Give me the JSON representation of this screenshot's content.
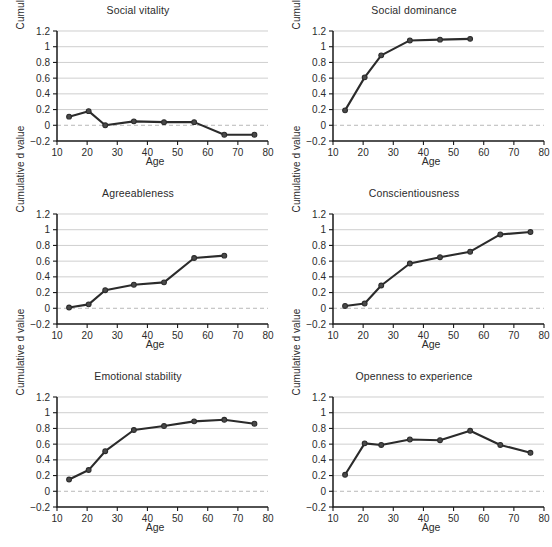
{
  "figure": {
    "axis_label_x": "Age",
    "axis_label_y": "Cumulative d value",
    "x_ticks": [
      "10",
      "20",
      "30",
      "40",
      "50",
      "60",
      "70",
      "80"
    ],
    "y_ticks": [
      "1.2",
      "1",
      "0.8",
      "0.6",
      "0.4",
      "0.2",
      "0",
      "−0.2"
    ],
    "line_color": "#2b2b2b",
    "grid_color": "#b9b9b9",
    "zero_line_color": "#b0b0b0",
    "background_color": "#ffffff"
  },
  "chart_data": [
    {
      "type": "line",
      "title": "Social vitality",
      "xlabel": "Age",
      "ylabel": "Cumulative d value",
      "xlim": [
        10,
        80
      ],
      "ylim": [
        -0.2,
        1.2
      ],
      "xticks": [
        10,
        20,
        30,
        40,
        50,
        60,
        70,
        80
      ],
      "yticks": [
        -0.2,
        0,
        0.2,
        0.4,
        0.6,
        0.8,
        1,
        1.2
      ],
      "grid": "horizontal",
      "legend": "none",
      "x": [
        14,
        20.5,
        26,
        35.5,
        45.5,
        55.5,
        65.5,
        75.5
      ],
      "values": [
        0.11,
        0.18,
        0.0,
        0.05,
        0.04,
        0.04,
        -0.12,
        -0.12
      ]
    },
    {
      "type": "line",
      "title": "Social dominance",
      "xlabel": "Age",
      "ylabel": "Cumulative d value",
      "xlim": [
        10,
        80
      ],
      "ylim": [
        -0.2,
        1.2
      ],
      "xticks": [
        10,
        20,
        30,
        40,
        50,
        60,
        70,
        80
      ],
      "yticks": [
        -0.2,
        0,
        0.2,
        0.4,
        0.6,
        0.8,
        1,
        1.2
      ],
      "grid": "horizontal",
      "legend": "none",
      "x": [
        14,
        20.5,
        26,
        35.5,
        45.5,
        55.5
      ],
      "values": [
        0.19,
        0.61,
        0.89,
        1.08,
        1.09,
        1.1
      ]
    },
    {
      "type": "line",
      "title": "Agreeableness",
      "xlabel": "Age",
      "ylabel": "Cumulative d value",
      "xlim": [
        10,
        80
      ],
      "ylim": [
        -0.2,
        1.2
      ],
      "xticks": [
        10,
        20,
        30,
        40,
        50,
        60,
        70,
        80
      ],
      "yticks": [
        -0.2,
        0,
        0.2,
        0.4,
        0.6,
        0.8,
        1,
        1.2
      ],
      "grid": "horizontal",
      "legend": "none",
      "x": [
        14,
        20.5,
        26,
        35.5,
        45.5,
        55.5,
        65.5
      ],
      "values": [
        0.01,
        0.05,
        0.23,
        0.3,
        0.33,
        0.64,
        0.67
      ]
    },
    {
      "type": "line",
      "title": "Conscientiousness",
      "xlabel": "Age",
      "ylabel": "Cumulative d value",
      "xlim": [
        10,
        80
      ],
      "ylim": [
        -0.2,
        1.2
      ],
      "xticks": [
        10,
        20,
        30,
        40,
        50,
        60,
        70,
        80
      ],
      "yticks": [
        -0.2,
        0,
        0.2,
        0.4,
        0.6,
        0.8,
        1,
        1.2
      ],
      "grid": "horizontal",
      "legend": "none",
      "x": [
        14,
        20.5,
        26,
        35.5,
        45.5,
        55.5,
        65.5,
        75.5
      ],
      "values": [
        0.03,
        0.06,
        0.29,
        0.57,
        0.65,
        0.72,
        0.94,
        0.97
      ]
    },
    {
      "type": "line",
      "title": "Emotional stability",
      "xlabel": "Age",
      "ylabel": "Cumulative d value",
      "xlim": [
        10,
        80
      ],
      "ylim": [
        -0.2,
        1.2
      ],
      "xticks": [
        10,
        20,
        30,
        40,
        50,
        60,
        70,
        80
      ],
      "yticks": [
        -0.2,
        0,
        0.2,
        0.4,
        0.6,
        0.8,
        1,
        1.2
      ],
      "grid": "horizontal",
      "legend": "none",
      "x": [
        14,
        20.5,
        26,
        35.5,
        45.5,
        55.5,
        65.5,
        75.5
      ],
      "values": [
        0.15,
        0.27,
        0.51,
        0.78,
        0.83,
        0.89,
        0.91,
        0.86
      ]
    },
    {
      "type": "line",
      "title": "Openness to experience",
      "xlabel": "Age",
      "ylabel": "Cumulative d value",
      "xlim": [
        10,
        80
      ],
      "ylim": [
        -0.2,
        1.2
      ],
      "xticks": [
        10,
        20,
        30,
        40,
        50,
        60,
        70,
        80
      ],
      "yticks": [
        -0.2,
        0,
        0.2,
        0.4,
        0.6,
        0.8,
        1,
        1.2
      ],
      "grid": "horizontal",
      "legend": "none",
      "x": [
        14,
        20.5,
        26,
        35.5,
        45.5,
        55.5,
        65.5,
        75.5
      ],
      "values": [
        0.21,
        0.61,
        0.59,
        0.66,
        0.65,
        0.77,
        0.59,
        0.49
      ]
    }
  ]
}
